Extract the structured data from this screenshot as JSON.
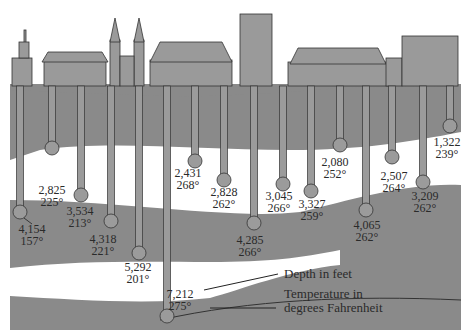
{
  "colors": {
    "rock_dark": "#8a8a8a",
    "rock_light": "#ffffff",
    "pipe": "#9b9b9b",
    "outline": "#333333",
    "building": "#9a9a9a",
    "text": "#2a2a2a"
  },
  "legend": {
    "depth_label": "Depth in feet",
    "temperature_label_line1": "Temperature in",
    "temperature_label_line2": "degrees Fahrenheit"
  },
  "wells": [
    {
      "depth": "4,154",
      "temp": "157°"
    },
    {
      "depth": "2,825",
      "temp": "225°"
    },
    {
      "depth": "3,534",
      "temp": "213°"
    },
    {
      "depth": "4,318",
      "temp": "221°"
    },
    {
      "depth": "5,292",
      "temp": "201°"
    },
    {
      "depth": "7,212",
      "temp": "275°"
    },
    {
      "depth": "2,431",
      "temp": "268°"
    },
    {
      "depth": "2,828",
      "temp": "262°"
    },
    {
      "depth": "4,285",
      "temp": "266°"
    },
    {
      "depth": "3,045",
      "temp": "266°"
    },
    {
      "depth": "3,327",
      "temp": "259°"
    },
    {
      "depth": "2,080",
      "temp": "252°"
    },
    {
      "depth": "4,065",
      "temp": "262°"
    },
    {
      "depth": "2,507",
      "temp": "264°"
    },
    {
      "depth": "3,209",
      "temp": "262°"
    },
    {
      "depth": "1,322",
      "temp": "239°"
    }
  ]
}
